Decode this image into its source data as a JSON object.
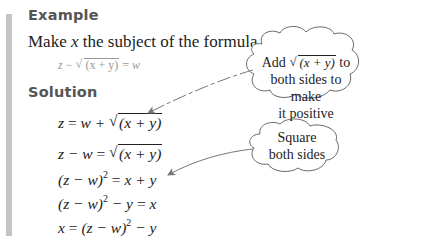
{
  "example": {
    "heading": "Example",
    "prompt_pre": "Make ",
    "prompt_var": "x",
    "prompt_post": " the subject of the formula",
    "formula": {
      "lhs": "z",
      "op1": " − ",
      "radicand": "(x + y)",
      "op2": " = ",
      "rhs": "w"
    }
  },
  "solution": {
    "heading": "Solution",
    "steps": [
      {
        "lhs": "z",
        "eq": " = ",
        "rhs_pre": "w + ",
        "radicand": "(x + y)"
      },
      {
        "lhs": "z − w",
        "eq": " = ",
        "radicand": "(x + y)"
      },
      {
        "lhs_pre": "(z − w)",
        "exp": "2",
        "eq": " = ",
        "rhs": "x + y"
      },
      {
        "lhs_pre": "(z − w)",
        "exp": "2",
        "lhs_post": " − y",
        "eq": " = ",
        "rhs": "x"
      },
      {
        "lhs": "x",
        "eq": " = ",
        "rhs_pre": "(z − w)",
        "exp": "2",
        "rhs_post": " − y"
      }
    ]
  },
  "callouts": [
    {
      "line1_pre": "Add ",
      "line1_radicand": "(x + y)",
      "line1_post": " to",
      "line2": "both sides to make",
      "line3": "it positive"
    },
    {
      "line1": "Square",
      "line2": "both sides"
    }
  ],
  "colors": {
    "sidebar_bar": "#c4c4c4",
    "heading": "#555555",
    "text": "#222222",
    "arrow": "#777777"
  }
}
